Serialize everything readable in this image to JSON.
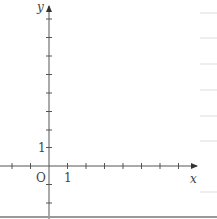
{
  "diagram": {
    "type": "coordinate-plane",
    "axes": {
      "x_label": "x",
      "y_label": "y",
      "origin_label": "O",
      "x_unit_label": "1",
      "y_unit_label": "1"
    },
    "ticks": {
      "x_negative_count": 2,
      "x_positive_count": 6,
      "y_positive_count": 8,
      "y_negative_count": 2,
      "unit_px": 18.5
    },
    "colors": {
      "axis": "#555555",
      "label": "#444444",
      "bottom_rule": "#999999",
      "margin_lines": "#dddddd"
    }
  }
}
